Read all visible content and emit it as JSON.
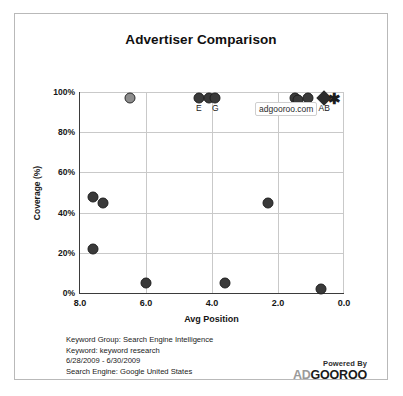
{
  "chart_data": {
    "type": "scatter",
    "title": "Advertiser Comparison",
    "xlabel": "Avg Position",
    "ylabel": "Coverage (%)",
    "xlim": [
      8.0,
      0.0
    ],
    "ylim": [
      0,
      100
    ],
    "x_reversed": true,
    "grid": true,
    "legend": "none",
    "xticks": [
      "8.0",
      "6.0",
      "4.0",
      "2.0",
      "0.0"
    ],
    "xtick_values": [
      8.0,
      6.0,
      4.0,
      2.0,
      0.0
    ],
    "yticks": [
      "0%",
      "20%",
      "40%",
      "60%",
      "80%",
      "100%"
    ],
    "ytick_values": [
      0,
      20,
      40,
      60,
      80,
      100
    ],
    "annotation": "adgooroo.com",
    "points": [
      {
        "x": 7.6,
        "y": 48,
        "label": "",
        "marker": "circle",
        "fill": "#3a3a3a"
      },
      {
        "x": 7.3,
        "y": 45,
        "label": "",
        "marker": "circle",
        "fill": "#3a3a3a"
      },
      {
        "x": 7.6,
        "y": 22,
        "label": "",
        "marker": "circle",
        "fill": "#3a3a3a"
      },
      {
        "x": 6.5,
        "y": 97,
        "label": "",
        "marker": "circle",
        "fill": "#8d8d8d"
      },
      {
        "x": 6.0,
        "y": 5,
        "label": "",
        "marker": "circle",
        "fill": "#3a3a3a"
      },
      {
        "x": 4.4,
        "y": 97,
        "label": "E",
        "marker": "circle",
        "fill": "#3a3a3a"
      },
      {
        "x": 4.1,
        "y": 97,
        "label": "",
        "marker": "circle",
        "fill": "#3a3a3a"
      },
      {
        "x": 3.9,
        "y": 97,
        "label": "G",
        "marker": "circle",
        "fill": "#3a3a3a"
      },
      {
        "x": 3.6,
        "y": 5,
        "label": "",
        "marker": "circle",
        "fill": "#3a3a3a"
      },
      {
        "x": 2.3,
        "y": 45,
        "label": "",
        "marker": "circle",
        "fill": "#3a3a3a"
      },
      {
        "x": 1.5,
        "y": 97,
        "label": "D",
        "marker": "circle",
        "fill": "#3a3a3a"
      },
      {
        "x": 1.4,
        "y": 96,
        "label": "F",
        "marker": "circle",
        "fill": "#3a3a3a"
      },
      {
        "x": 1.1,
        "y": 97,
        "label": "C",
        "marker": "circle",
        "fill": "#3a3a3a"
      },
      {
        "x": 0.6,
        "y": 97,
        "label": "AB",
        "marker": "diamond",
        "fill": "#2b2b2b"
      },
      {
        "x": 0.3,
        "y": 97,
        "label": "",
        "marker": "star",
        "fill": "#1c1c1c"
      },
      {
        "x": 0.7,
        "y": 2,
        "label": "",
        "marker": "circle",
        "fill": "#3a3a3a"
      }
    ]
  },
  "footer": {
    "lines": [
      "Keyword Group: Search Engine Intelligence",
      "Keyword: keyword research",
      "6/28/2009 - 6/30/2009",
      "Search Engine: Google United States"
    ]
  },
  "branding": {
    "powered_by": "Powered By",
    "brand_prefix": "AD",
    "brand_suffix": "GOOROO"
  },
  "colors": {
    "marker_dark": "#3a3a3a",
    "marker_light": "#8d8d8d",
    "grid": "#c9c9c9",
    "axis": "#3b3b3b",
    "frame": "#b9b9b9"
  }
}
